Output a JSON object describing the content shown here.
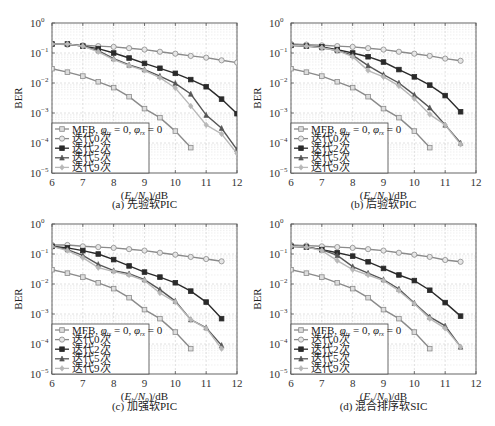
{
  "chart_data": [
    {
      "type": "line",
      "id": "a",
      "title": "(a) 先验软PIC",
      "xlabel": "(E_b/N_0)/dB",
      "ylabel": "BER",
      "yscale": "log",
      "xlim": [
        6,
        12
      ],
      "ylim": [
        1e-05,
        1
      ],
      "xticks": [
        6,
        7,
        8,
        9,
        10,
        11,
        12
      ],
      "yticks": [
        "10^0",
        "10^-1",
        "10^-2",
        "10^-3",
        "10^-4",
        "10^-5"
      ],
      "grid": true,
      "legend_position": "lower left",
      "series": [
        {
          "name": "MFB, φ_tx = 0, φ_rx = 0",
          "marker": "square",
          "color": "#8a8a8a",
          "x": [
            6,
            6.5,
            7,
            7.5,
            8,
            8.5,
            9,
            9.5,
            10,
            10.5
          ],
          "values": [
            0.03,
            0.023,
            0.017,
            0.011,
            0.007,
            0.0035,
            0.0014,
            0.0007,
            0.00025,
            7e-05
          ]
        },
        {
          "name": "迭代0次",
          "marker": "circle",
          "color": "#8a8a8a",
          "x": [
            6,
            6.5,
            7,
            7.5,
            8,
            8.5,
            9,
            9.5,
            10,
            10.5,
            11,
            11.5,
            12
          ],
          "values": [
            0.2,
            0.19,
            0.18,
            0.17,
            0.16,
            0.145,
            0.13,
            0.11,
            0.095,
            0.08,
            0.07,
            0.057,
            0.048
          ]
        },
        {
          "name": "迭代2次",
          "marker": "square-filled",
          "color": "#2a2a2a",
          "x": [
            6,
            6.5,
            7,
            7.5,
            8,
            8.5,
            9,
            9.5,
            10,
            10.5,
            11,
            11.5,
            12
          ],
          "values": [
            0.2,
            0.2,
            0.17,
            0.14,
            0.1,
            0.068,
            0.045,
            0.031,
            0.021,
            0.013,
            0.0075,
            0.0029,
            0.00095
          ]
        },
        {
          "name": "迭代5次",
          "marker": "triangle",
          "color": "#555555",
          "x": [
            6,
            6.5,
            7,
            7.5,
            8,
            8.5,
            9,
            9.5,
            10,
            10.5,
            11,
            11.5,
            12
          ],
          "values": [
            0.2,
            0.2,
            0.17,
            0.12,
            0.065,
            0.04,
            0.028,
            0.017,
            0.0098,
            0.0043,
            0.00085,
            0.00031,
            6e-05
          ]
        },
        {
          "name": "迭代9次",
          "marker": "diamond",
          "color": "#b8b8b8",
          "x": [
            6,
            6.5,
            7,
            7.5,
            8,
            8.5,
            9,
            9.5,
            10,
            10.5,
            11,
            11.5,
            12
          ],
          "values": [
            0.2,
            0.2,
            0.17,
            0.11,
            0.06,
            0.038,
            0.026,
            0.015,
            0.0068,
            0.0017,
            0.0004,
            0.0002,
            4.5e-05
          ]
        }
      ]
    },
    {
      "type": "line",
      "id": "b",
      "title": "(b) 后验软PIC",
      "xlabel": "(E_b/N_0)/dB",
      "ylabel": "BER",
      "yscale": "log",
      "xlim": [
        6,
        12
      ],
      "ylim": [
        1e-05,
        1
      ],
      "xticks": [
        6,
        7,
        8,
        9,
        10,
        11,
        12
      ],
      "yticks": [
        "10^0",
        "10^-1",
        "10^-2",
        "10^-3",
        "10^-4",
        "10^-5"
      ],
      "grid": true,
      "legend_position": "lower left",
      "series": [
        {
          "name": "MFB, φ_tx = 0, φ_rx = 0",
          "marker": "square",
          "color": "#8a8a8a",
          "x": [
            6,
            6.5,
            7,
            7.5,
            8,
            8.5,
            9,
            9.5,
            10,
            10.5
          ],
          "values": [
            0.03,
            0.023,
            0.017,
            0.011,
            0.007,
            0.0035,
            0.0014,
            0.0007,
            0.00025,
            7e-05
          ]
        },
        {
          "name": "迭代0次",
          "marker": "circle",
          "color": "#8a8a8a",
          "x": [
            6,
            6.5,
            7,
            7.5,
            8,
            8.5,
            9,
            9.5,
            10,
            10.5,
            11,
            11.5
          ],
          "values": [
            0.2,
            0.19,
            0.18,
            0.17,
            0.16,
            0.145,
            0.13,
            0.11,
            0.095,
            0.08,
            0.065,
            0.055
          ]
        },
        {
          "name": "迭代2次",
          "marker": "square-filled",
          "color": "#2a2a2a",
          "x": [
            6,
            6.5,
            7,
            7.5,
            8,
            8.5,
            9,
            9.5,
            10,
            10.5,
            11,
            11.5
          ],
          "values": [
            0.18,
            0.17,
            0.16,
            0.13,
            0.1,
            0.075,
            0.05,
            0.028,
            0.016,
            0.0085,
            0.0038,
            0.0011
          ]
        },
        {
          "name": "迭代5次",
          "marker": "triangle",
          "color": "#555555",
          "x": [
            6,
            6.5,
            7,
            7.5,
            8,
            8.5,
            9,
            9.5,
            10,
            10.5,
            11,
            11.5
          ],
          "values": [
            0.18,
            0.17,
            0.15,
            0.12,
            0.085,
            0.038,
            0.019,
            0.01,
            0.004,
            0.0015,
            0.0004,
            0.0001
          ]
        },
        {
          "name": "迭代9次",
          "marker": "diamond",
          "color": "#b8b8b8",
          "x": [
            6,
            6.5,
            7,
            7.5,
            8,
            8.5,
            9,
            9.5,
            10,
            10.5,
            11,
            11.5
          ],
          "values": [
            0.18,
            0.17,
            0.15,
            0.12,
            0.075,
            0.026,
            0.016,
            0.008,
            0.003,
            0.0009,
            0.0004,
            9e-05
          ]
        }
      ]
    },
    {
      "type": "line",
      "id": "c",
      "title": "(c) 加强软PIC",
      "xlabel": "(E_b/N_0)/dB",
      "ylabel": "BER",
      "yscale": "log",
      "xlim": [
        6,
        12
      ],
      "ylim": [
        1e-05,
        1
      ],
      "xticks": [
        6,
        7,
        8,
        9,
        10,
        11,
        12
      ],
      "yticks": [
        "10^0",
        "10^-1",
        "10^-2",
        "10^-3",
        "10^-4",
        "10^-5"
      ],
      "grid": true,
      "legend_position": "lower left",
      "series": [
        {
          "name": "MFB, φ_tx = 0, φ_rx = 0",
          "marker": "square",
          "color": "#8a8a8a",
          "x": [
            6,
            6.5,
            7,
            7.5,
            8,
            8.5,
            9,
            9.5,
            10,
            10.5
          ],
          "values": [
            0.03,
            0.023,
            0.017,
            0.011,
            0.007,
            0.0035,
            0.0014,
            0.0007,
            0.00025,
            7e-05
          ]
        },
        {
          "name": "迭代0次",
          "marker": "circle",
          "color": "#8a8a8a",
          "x": [
            6,
            6.5,
            7,
            7.5,
            8,
            8.5,
            9,
            9.5,
            10,
            10.5,
            11,
            11.5
          ],
          "values": [
            0.2,
            0.2,
            0.18,
            0.17,
            0.16,
            0.145,
            0.13,
            0.11,
            0.095,
            0.08,
            0.068,
            0.057
          ]
        },
        {
          "name": "迭代2次",
          "marker": "square-filled",
          "color": "#2a2a2a",
          "x": [
            6,
            6.5,
            7,
            7.5,
            8,
            8.5,
            9,
            9.5,
            10,
            10.5,
            11,
            11.5
          ],
          "values": [
            0.18,
            0.16,
            0.13,
            0.1,
            0.065,
            0.04,
            0.025,
            0.017,
            0.011,
            0.0058,
            0.0025,
            0.0007
          ]
        },
        {
          "name": "迭代5次",
          "marker": "triangle",
          "color": "#555555",
          "x": [
            6,
            6.5,
            7,
            7.5,
            8,
            8.5,
            9,
            9.5,
            10,
            10.5,
            11,
            11.5
          ],
          "values": [
            0.18,
            0.14,
            0.09,
            0.045,
            0.028,
            0.022,
            0.014,
            0.0065,
            0.0027,
            0.00065,
            0.00035,
            9e-05
          ]
        },
        {
          "name": "迭代9次",
          "marker": "diamond",
          "color": "#b8b8b8",
          "x": [
            6,
            6.5,
            7,
            7.5,
            8,
            8.5,
            9,
            9.5,
            10,
            10.5,
            11,
            11.5
          ],
          "values": [
            0.18,
            0.13,
            0.075,
            0.035,
            0.026,
            0.02,
            0.013,
            0.005,
            0.0025,
            0.00065,
            0.00033,
            7e-05
          ]
        }
      ]
    },
    {
      "type": "line",
      "id": "d",
      "title": "(d) 混合排序软SIC",
      "xlabel": "(E_b/N_0)/dB",
      "ylabel": "BER",
      "yscale": "log",
      "xlim": [
        6,
        12
      ],
      "ylim": [
        1e-05,
        1
      ],
      "xticks": [
        6,
        7,
        8,
        9,
        10,
        11,
        12
      ],
      "yticks": [
        "10^0",
        "10^-1",
        "10^-2",
        "10^-3",
        "10^-4",
        "10^-5"
      ],
      "grid": true,
      "legend_position": "lower left",
      "series": [
        {
          "name": "MFB, φ_tx = 0, φ_rx = 0",
          "marker": "square",
          "color": "#8a8a8a",
          "x": [
            6,
            6.5,
            7,
            7.5,
            8,
            8.5,
            9,
            9.5,
            10,
            10.5
          ],
          "values": [
            0.03,
            0.023,
            0.017,
            0.011,
            0.007,
            0.0035,
            0.0014,
            0.0007,
            0.00025,
            7e-05
          ]
        },
        {
          "name": "迭代0次",
          "marker": "circle",
          "color": "#8a8a8a",
          "x": [
            6,
            6.5,
            7,
            7.5,
            8,
            8.5,
            9,
            9.5,
            10,
            10.5,
            11,
            11.5
          ],
          "values": [
            0.2,
            0.19,
            0.18,
            0.17,
            0.16,
            0.145,
            0.13,
            0.11,
            0.095,
            0.08,
            0.063,
            0.055
          ]
        },
        {
          "name": "迭代2次",
          "marker": "square-filled",
          "color": "#2a2a2a",
          "x": [
            6,
            6.5,
            7,
            7.5,
            8,
            8.5,
            9,
            9.5,
            10,
            10.5,
            11,
            11.5
          ],
          "values": [
            0.18,
            0.17,
            0.14,
            0.11,
            0.085,
            0.055,
            0.033,
            0.02,
            0.013,
            0.0062,
            0.0024,
            0.00085
          ]
        },
        {
          "name": "迭代5次",
          "marker": "triangle",
          "color": "#555555",
          "x": [
            6,
            6.5,
            7,
            7.5,
            8,
            8.5,
            9,
            9.5,
            10,
            10.5,
            11,
            11.5
          ],
          "values": [
            0.18,
            0.17,
            0.14,
            0.09,
            0.038,
            0.023,
            0.014,
            0.0068,
            0.0023,
            0.0008,
            0.0004,
            8e-05
          ]
        },
        {
          "name": "迭代9次",
          "marker": "diamond",
          "color": "#b8b8b8",
          "x": [
            6,
            6.5,
            7,
            7.5,
            8,
            8.5,
            9,
            9.5,
            10,
            10.5,
            11,
            11.5
          ],
          "values": [
            0.18,
            0.17,
            0.13,
            0.06,
            0.03,
            0.02,
            0.013,
            0.006,
            0.0022,
            0.0007,
            0.00033,
            8e-05
          ]
        }
      ]
    }
  ],
  "panels": [
    {
      "caption": "(a) 先验软PIC",
      "xlabel_main": "(E",
      "xlabel_sub1": "b",
      "xlabel_mid": "/N",
      "xlabel_sub2": "0",
      "xlabel_end": ")/dB",
      "ylabel": "BER"
    },
    {
      "caption": "(b) 后验软PIC",
      "xlabel_main": "(E",
      "xlabel_sub1": "b",
      "xlabel_mid": "/N",
      "xlabel_sub2": "0",
      "xlabel_end": ")/dB",
      "ylabel": "BER"
    },
    {
      "caption": "(c) 加强软PIC",
      "xlabel_main": "(E",
      "xlabel_sub1": "b",
      "xlabel_mid": "/N",
      "xlabel_sub2": "0",
      "xlabel_end": ")/dB",
      "ylabel": "BER"
    },
    {
      "caption": "(d) 混合排序软SIC",
      "xlabel_main": "(E",
      "xlabel_sub1": "b",
      "xlabel_mid": "/N",
      "xlabel_sub2": "0",
      "xlabel_end": ")/dB",
      "ylabel": "BER"
    }
  ],
  "legend": {
    "mfb_prefix": "MFB, ",
    "phi": "φ",
    "tx": "tx",
    "rx": "rx",
    "eq0": " = 0, ",
    "eq0_end": " = 0",
    "items": [
      "迭代0次",
      "迭代2次",
      "迭代5次",
      "迭代9次"
    ]
  }
}
